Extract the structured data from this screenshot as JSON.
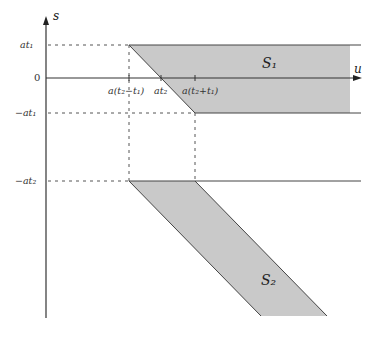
{
  "diagram": {
    "axes": {
      "vertical_label": "s",
      "horizontal_label": "u",
      "origin_label": "0"
    },
    "y_ticks": [
      {
        "label": "at₁",
        "y": 45
      },
      {
        "label": "0",
        "y": 78
      },
      {
        "label": "−at₁",
        "y": 113
      },
      {
        "label": "−at₂",
        "y": 181
      }
    ],
    "x_ticks": [
      {
        "label": "a(t₂−t₁)",
        "x": 129
      },
      {
        "label": "at₂",
        "x": 161
      },
      {
        "label": "a(t₂+t₁)",
        "x": 195
      }
    ],
    "regions": [
      {
        "name": "S₁",
        "sub": "1",
        "fill": "#c8c8c8"
      },
      {
        "name": "S₂",
        "sub": "2",
        "fill": "#c8c8c8"
      }
    ],
    "colors": {
      "line": "#444444",
      "region_fill": "#c9c9c9",
      "dash": "#555555"
    }
  }
}
